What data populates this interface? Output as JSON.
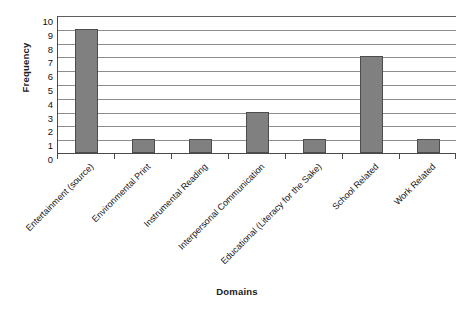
{
  "chart_data": {
    "type": "bar",
    "title": "",
    "xlabel": "Domains",
    "ylabel": "Frequency",
    "categories": [
      "Entertainment (source)",
      "Environmental Print",
      "Instrumental Reading",
      "Interpersonal Communication",
      "Educational (Literacy for the Sake)",
      "School Related",
      "Work Related"
    ],
    "values": [
      9,
      1,
      1,
      3,
      1,
      7,
      1
    ],
    "ylim": [
      0,
      10
    ],
    "ytick_step": 1,
    "yticks": [
      "10",
      "9",
      "8",
      "7",
      "6",
      "5",
      "4",
      "3",
      "2",
      "1",
      "0"
    ],
    "grid": true,
    "grid_axis": "y",
    "legend": false,
    "legend_position": "none",
    "orientation": "vertical",
    "xtick_label_rotation": -45
  },
  "style": {
    "bar_fill": "#808080",
    "bar_edge": "#4d4d4d",
    "gridline_color": "#8d8d8d",
    "axis_color": "#4a4a4a",
    "background": "#ffffff",
    "text_color": "#141414"
  }
}
